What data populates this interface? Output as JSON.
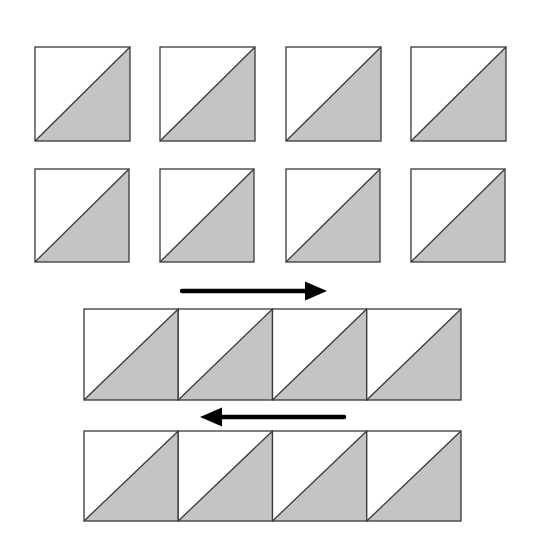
{
  "diagram": {
    "title": "",
    "colors": {
      "background": "#ffffff",
      "light_fabric": "#ffffff",
      "dark_fabric": "#c4c4c4",
      "outline": "#3a3a3a",
      "arrow": "#000000"
    },
    "loose_rows": [
      {
        "y": 47,
        "size": 94,
        "blocks_x": [
          35,
          160,
          286,
          411
        ]
      },
      {
        "y": 169,
        "size": 93,
        "blocks_x": [
          35,
          160,
          286,
          411
        ]
      }
    ],
    "sewn_rows": [
      {
        "y": 309,
        "height": 91,
        "x_start": 84,
        "block_width": 94.25,
        "count": 4
      },
      {
        "y": 431,
        "height": 90,
        "x_start": 84,
        "block_width": 94.25,
        "count": 4
      }
    ],
    "arrows": [
      {
        "name": "press-right-arrow",
        "direction": "right",
        "x1": 182,
        "x2": 327,
        "y": 291
      },
      {
        "name": "press-left-arrow",
        "direction": "left",
        "x1": 344,
        "x2": 200,
        "y": 417
      }
    ]
  }
}
